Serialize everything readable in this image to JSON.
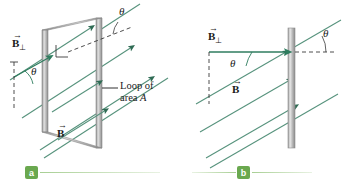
{
  "figure": {
    "background": "#ffffff",
    "width": 351,
    "height": 186
  },
  "colors": {
    "field_line": "#57937d",
    "field_arrow": "#2f6b54",
    "vector_green": "#2f7d5f",
    "loop_frame": "#9a9a9a",
    "loop_frame_light": "#d8d8d8",
    "plate_dark": "#8e8e8e",
    "plate_light": "#e6e6e6",
    "dashed": "#3a3a3a",
    "text": "#1a1a1a",
    "caption_green": "#6aa84f",
    "caption_rule": "#a8cf94"
  },
  "panel_a": {
    "caption_letter": "a",
    "labels": {
      "b_perp": {
        "symbol": "B",
        "subscript": "⊥",
        "vector_accent": "→"
      },
      "theta_top": "θ",
      "theta_left": "θ",
      "b_field": {
        "symbol": "B",
        "vector_accent": "→"
      },
      "loop_line1": "Loop of",
      "loop_line2_prefix": "area ",
      "loop_area_symbol": "A"
    },
    "field_line_count": 5,
    "right_angle_marker": true
  },
  "panel_b": {
    "caption_letter": "b",
    "labels": {
      "b_perp": {
        "symbol": "B",
        "subscript": "⊥",
        "vector_accent": "→"
      },
      "theta_right": "θ",
      "theta_inner": "θ",
      "b_field": {
        "symbol": "B",
        "vector_accent": "→"
      }
    },
    "field_line_count": 4,
    "plate_edge_on": true
  }
}
